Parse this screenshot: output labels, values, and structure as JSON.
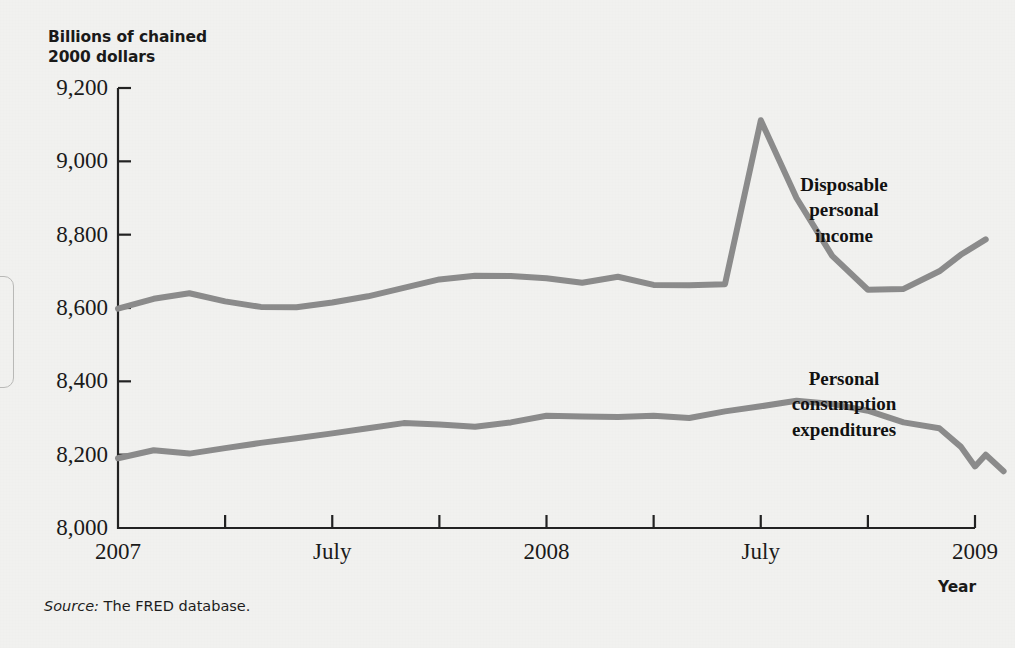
{
  "figure": {
    "y_axis_title": "Billions of chained\n2000 dollars",
    "x_axis_title": "Year",
    "source_keyword": "Source:",
    "source_text": " The FRED database.",
    "line_color": "#8b8b8b",
    "axis_color": "#222222",
    "background_color": "#f1f1ef"
  },
  "chart_data": {
    "type": "line",
    "title": "",
    "subtitle": "",
    "xlabel": "Year",
    "ylabel": "Billions of chained 2000 dollars",
    "ylim": [
      8000,
      9200
    ],
    "ytick_labels": [
      "8,000",
      "8,200",
      "8,400",
      "8,600",
      "8,800",
      "9,000",
      "9,200"
    ],
    "ytick_values": [
      8000,
      8200,
      8400,
      8600,
      8800,
      9000,
      9200
    ],
    "xtick_labels": [
      "2007",
      "",
      "July",
      "",
      "2008",
      "",
      "July",
      "",
      "2009"
    ],
    "xtick_values": [
      0,
      3,
      6,
      9,
      12,
      15,
      18,
      21,
      24
    ],
    "xtick_major_labels": [
      "2007",
      "July",
      "2008",
      "July",
      "2009"
    ],
    "xlim": [
      0,
      24
    ],
    "grid": false,
    "legend_position": "inline-annotation",
    "x": [
      0,
      1,
      2,
      3,
      4,
      5,
      6,
      7,
      8,
      9,
      10,
      11,
      12,
      13,
      14,
      15,
      16,
      17,
      18,
      19,
      20,
      21,
      22,
      23
    ],
    "x_month_labels": [
      "Jan 2007",
      "Feb 2007",
      "Mar 2007",
      "Apr 2007",
      "May 2007",
      "Jun 2007",
      "Jul 2007",
      "Aug 2007",
      "Sep 2007",
      "Oct 2007",
      "Nov 2007",
      "Dec 2007",
      "Jan 2008",
      "Feb 2008",
      "Mar 2008",
      "Apr 2008",
      "May 2008",
      "Jun 2008",
      "Jul 2008",
      "Aug 2008",
      "Sep 2008",
      "Oct 2008",
      "Nov 2008",
      "Dec 2008"
    ],
    "series": [
      {
        "name": "Disposable personal income",
        "label": "Disposable\npersonal\nincome",
        "color": "#8b8b8b",
        "values": [
          8598,
          8625,
          8640,
          8618,
          8603,
          8602,
          8615,
          8632,
          8655,
          8678,
          8688,
          8687,
          8681,
          8669,
          8685,
          8663,
          8662,
          8665,
          9112,
          8900,
          8742,
          8650,
          8652,
          8700
        ]
      },
      {
        "name": "Personal consumption expenditures",
        "label": "Personal\nconsumption\nexpenditures",
        "color": "#8b8b8b",
        "values": [
          8190,
          8212,
          8203,
          8218,
          8232,
          8245,
          8258,
          8272,
          8286,
          8282,
          8276,
          8288,
          8306,
          8304,
          8303,
          8306,
          8300,
          8318,
          8332,
          8347,
          8338,
          8320,
          8288,
          8272
        ]
      }
    ],
    "series_extra_points": {
      "Disposable personal income": [
        {
          "x": 23.6,
          "y": 8745
        },
        {
          "x": 24.3,
          "y": 8787
        }
      ],
      "Personal consumption expenditures": [
        {
          "x": 23.6,
          "y": 8222
        },
        {
          "x": 24.0,
          "y": 8168
        },
        {
          "x": 24.3,
          "y": 8200
        },
        {
          "x": 24.8,
          "y": 8155
        }
      ]
    },
    "annotations": [
      {
        "text": "Disposable personal income",
        "x": 19.5,
        "y": 8830
      },
      {
        "text": "Personal consumption expenditures",
        "x": 19.5,
        "y": 8420
      }
    ]
  }
}
